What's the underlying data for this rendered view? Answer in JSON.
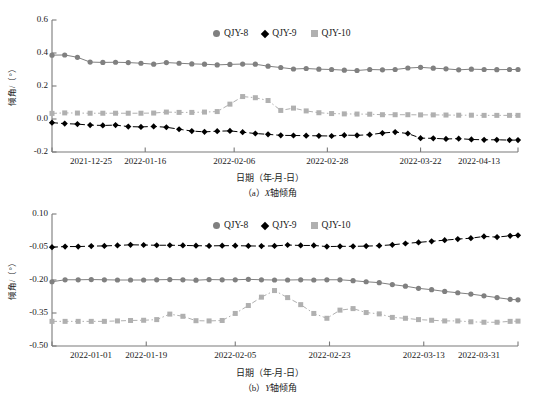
{
  "figure": {
    "panels": [
      {
        "id": "a",
        "caption_prefix": "（a）",
        "caption_ital": "X",
        "caption_suffix": "轴倾角",
        "axis_x_title": "日期（年-月-日）",
        "axis_y_title": "倾角/（°）"
      },
      {
        "id": "b",
        "caption_prefix": "（b）",
        "caption_ital": "Y",
        "caption_suffix": "轴倾角",
        "axis_x_title": "日期（年-月-日）",
        "axis_y_title": "倾角/（°）"
      }
    ],
    "legend": [
      {
        "label": "QJY-8",
        "marker": "circle-icon",
        "color": "#808080"
      },
      {
        "label": "QJY-9",
        "marker": "diamond-icon",
        "color": "#000000"
      },
      {
        "label": "QJY-10",
        "marker": "square-icon",
        "color": "#b0b0b0"
      }
    ]
  },
  "chart_data": [
    {
      "type": "line",
      "title": "(a) X轴倾角",
      "xlabel": "日期（年-月-日）",
      "ylabel": "倾角/（°）",
      "grid": false,
      "legend_position": "top-center",
      "xlim": [
        0,
        110
      ],
      "ylim": [
        -0.2,
        0.6
      ],
      "yticks": [
        "0.6",
        "0.4",
        "0.2",
        "0.0",
        "-0.2"
      ],
      "ytick_values": [
        0.6,
        0.4,
        0.2,
        0.0,
        -0.2
      ],
      "xticks": [
        "2021-12-25",
        "2022-01-16",
        "2022-02-06",
        "2022-02-28",
        "2022-03-22",
        "2022-04-13"
      ],
      "xtick_values": [
        0,
        22,
        43,
        65,
        87,
        110
      ],
      "x": [
        0,
        3,
        6,
        9,
        12,
        15,
        18,
        21,
        24,
        27,
        30,
        33,
        36,
        39,
        42,
        45,
        48,
        51,
        54,
        57,
        60,
        63,
        66,
        69,
        72,
        75,
        78,
        81,
        84,
        87,
        90,
        93,
        96,
        99,
        102,
        105,
        108,
        110
      ],
      "series": [
        {
          "name": "QJY-8",
          "color": "#808080",
          "marker": "circle",
          "linestyle": "solid",
          "values": [
            0.387,
            0.388,
            0.374,
            0.345,
            0.343,
            0.344,
            0.342,
            0.338,
            0.332,
            0.342,
            0.338,
            0.334,
            0.332,
            0.328,
            0.331,
            0.333,
            0.332,
            0.32,
            0.312,
            0.303,
            0.306,
            0.302,
            0.3,
            0.296,
            0.294,
            0.3,
            0.298,
            0.3,
            0.309,
            0.313,
            0.308,
            0.304,
            0.298,
            0.302,
            0.3,
            0.299,
            0.3,
            0.3
          ]
        },
        {
          "name": "QJY-9",
          "color": "#000000",
          "marker": "diamond",
          "linestyle": "dashed",
          "values": [
            -0.022,
            -0.028,
            -0.031,
            -0.037,
            -0.039,
            -0.037,
            -0.046,
            -0.048,
            -0.045,
            -0.05,
            -0.062,
            -0.073,
            -0.078,
            -0.074,
            -0.072,
            -0.08,
            -0.088,
            -0.093,
            -0.099,
            -0.1,
            -0.101,
            -0.102,
            -0.103,
            -0.098,
            -0.099,
            -0.095,
            -0.085,
            -0.079,
            -0.088,
            -0.116,
            -0.117,
            -0.121,
            -0.119,
            -0.124,
            -0.126,
            -0.126,
            -0.128,
            -0.128
          ]
        },
        {
          "name": "QJY-10",
          "color": "#b0b0b0",
          "marker": "square",
          "linestyle": "dashdot",
          "values": [
            0.034,
            0.037,
            0.036,
            0.035,
            0.035,
            0.035,
            0.035,
            0.035,
            0.036,
            0.042,
            0.04,
            0.04,
            0.042,
            0.045,
            0.09,
            0.136,
            0.129,
            0.112,
            0.052,
            0.066,
            0.049,
            0.038,
            0.033,
            0.031,
            0.03,
            0.029,
            0.026,
            0.026,
            0.026,
            0.025,
            0.025,
            0.024,
            0.023,
            0.023,
            0.022,
            0.022,
            0.022,
            0.022
          ]
        }
      ]
    },
    {
      "type": "line",
      "title": "(b) Y轴倾角",
      "xlabel": "日期（年-月-日）",
      "ylabel": "倾角/（°）",
      "grid": false,
      "legend_position": "top-center",
      "xlim": [
        0,
        89
      ],
      "ylim": [
        -0.5,
        0.1
      ],
      "yticks": [
        "0.10",
        "-0.05",
        "-0.20",
        "-0.35",
        "-0.50"
      ],
      "ytick_values": [
        0.1,
        -0.05,
        -0.2,
        -0.35,
        -0.5
      ],
      "xticks": [
        "2022-01-01",
        "2022-01-19",
        "2022-02-05",
        "2022-02-23",
        "2022-03-13",
        "2022-03-31"
      ],
      "xtick_values": [
        0,
        18,
        35,
        53,
        71,
        89
      ],
      "x": [
        0,
        2.5,
        5,
        7.5,
        10,
        12.5,
        15,
        17.5,
        20,
        22.5,
        25,
        27.5,
        30,
        32.5,
        35,
        37.5,
        40,
        42.5,
        45,
        47.5,
        50,
        52.5,
        55,
        57.5,
        60,
        62.5,
        65,
        67.5,
        70,
        72.5,
        75,
        77.5,
        80,
        82.5,
        85,
        87.5,
        89
      ],
      "series": [
        {
          "name": "QJY-8",
          "color": "#808080",
          "marker": "circle",
          "linestyle": "solid",
          "values": [
            -0.208,
            -0.199,
            -0.199,
            -0.198,
            -0.199,
            -0.2,
            -0.2,
            -0.2,
            -0.199,
            -0.198,
            -0.199,
            -0.201,
            -0.198,
            -0.199,
            -0.199,
            -0.197,
            -0.199,
            -0.2,
            -0.2,
            -0.199,
            -0.2,
            -0.199,
            -0.199,
            -0.203,
            -0.208,
            -0.212,
            -0.221,
            -0.228,
            -0.238,
            -0.244,
            -0.252,
            -0.258,
            -0.264,
            -0.272,
            -0.28,
            -0.288,
            -0.29
          ]
        },
        {
          "name": "QJY-9",
          "color": "#000000",
          "marker": "diamond",
          "linestyle": "dashed",
          "values": [
            -0.051,
            -0.048,
            -0.048,
            -0.046,
            -0.045,
            -0.043,
            -0.04,
            -0.041,
            -0.042,
            -0.042,
            -0.043,
            -0.044,
            -0.045,
            -0.044,
            -0.044,
            -0.045,
            -0.046,
            -0.045,
            -0.041,
            -0.043,
            -0.043,
            -0.048,
            -0.047,
            -0.047,
            -0.046,
            -0.044,
            -0.04,
            -0.034,
            -0.029,
            -0.024,
            -0.019,
            -0.014,
            -0.01,
            -0.002,
            -0.005,
            0.001,
            0.003
          ]
        },
        {
          "name": "QJY-10",
          "color": "#b0b0b0",
          "marker": "square",
          "linestyle": "dashdot",
          "values": [
            -0.388,
            -0.388,
            -0.388,
            -0.388,
            -0.388,
            -0.386,
            -0.384,
            -0.383,
            -0.38,
            -0.355,
            -0.365,
            -0.385,
            -0.386,
            -0.384,
            -0.352,
            -0.316,
            -0.278,
            -0.248,
            -0.28,
            -0.312,
            -0.352,
            -0.374,
            -0.337,
            -0.33,
            -0.348,
            -0.354,
            -0.37,
            -0.374,
            -0.38,
            -0.383,
            -0.386,
            -0.386,
            -0.39,
            -0.392,
            -0.392,
            -0.388,
            -0.387
          ]
        }
      ]
    }
  ]
}
